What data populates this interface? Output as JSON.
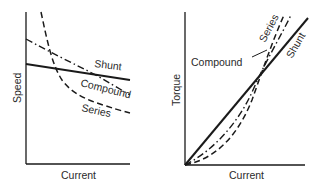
{
  "diagrams": [
    {
      "id": "speed-vs-current",
      "xlabel": "Current",
      "ylabel": "Speed",
      "curves": [
        {
          "name": "Shunt",
          "style": "solid",
          "label": "Shunt"
        },
        {
          "name": "Compound",
          "style": "dash-dot",
          "label": "Compound"
        },
        {
          "name": "Series",
          "style": "dashed",
          "label": "Series"
        }
      ]
    },
    {
      "id": "torque-vs-current",
      "xlabel": "Current",
      "ylabel": "Torque",
      "curves": [
        {
          "name": "Series",
          "style": "dashed",
          "label": "Series"
        },
        {
          "name": "Compound",
          "style": "dash-dot",
          "label": "Compound"
        },
        {
          "name": "Shunt",
          "style": "solid",
          "label": "Shunt"
        }
      ]
    }
  ],
  "colors": {
    "line": "#1a1a1a",
    "text": "#2a2a2a",
    "background": "#ffffff"
  }
}
